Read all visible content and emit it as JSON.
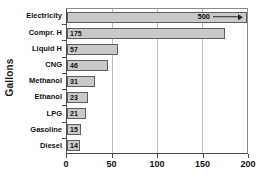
{
  "chart_data": {
    "type": "bar",
    "orientation": "horizontal",
    "title": "",
    "xlabel": "",
    "ylabel": "Gallons",
    "categories": [
      "Electricity",
      "Compr. H",
      "Liquid H",
      "CNG",
      "Methanol",
      "Ethanol",
      "LPG",
      "Gasoline",
      "Diesel"
    ],
    "values": [
      500,
      175,
      57,
      46,
      31,
      23,
      21,
      15,
      14
    ],
    "value_labels": [
      "500",
      "175",
      "57",
      "46",
      "31",
      "23",
      "21",
      "15",
      "14"
    ],
    "xlim": [
      0,
      200
    ],
    "xticks": [
      0,
      50,
      100,
      150,
      200
    ],
    "xtick_labels": [
      "0",
      "50",
      "100",
      "150",
      "200"
    ],
    "grid": true,
    "grid_axis": "x",
    "legend": "none",
    "annotations": [
      {
        "category": "Electricity",
        "text": "500",
        "note": "bar exceeds axis maximum; arrow points right to indicate off-scale value"
      }
    ],
    "colors": {
      "bar_fill": "#c9c9c9",
      "bar_edge": "#5d5d5d",
      "grid": "#bdbdbd",
      "axis": "#4a4a4a",
      "text": "#111111",
      "background": "#ffffff"
    }
  }
}
